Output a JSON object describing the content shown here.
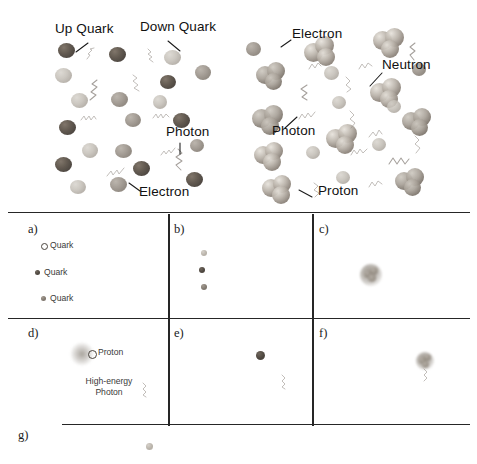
{
  "figure": {
    "background_color": "#ffffff",
    "ink_color": "#1a1a1a",
    "particle_color": "#6d6359",
    "photon_color": "#6f6760"
  },
  "top_panels": [
    {
      "id": "plasma-scene",
      "name": "quark-gluon-plasma-scene",
      "labels": [
        {
          "text": "Up Quark",
          "name": "label-up-quark",
          "x": 55,
          "y": 28
        },
        {
          "text": "Down Quark",
          "name": "label-down-quark",
          "x": 140,
          "y": 26
        },
        {
          "text": "Photon",
          "name": "label-photon",
          "x": 168,
          "y": 131
        },
        {
          "text": "Electron",
          "name": "label-electron",
          "x": 139,
          "y": 191
        }
      ]
    },
    {
      "id": "hadron-scene",
      "name": "hadronized-matter-scene",
      "labels": [
        {
          "text": "Electron",
          "name": "label-electron",
          "x": 292,
          "y": 33
        },
        {
          "text": "Neutron",
          "name": "label-neutron",
          "x": 382,
          "y": 64
        },
        {
          "text": "Photon",
          "name": "label-photon",
          "x": 272,
          "y": 130
        },
        {
          "text": "Proton",
          "name": "label-proton",
          "x": 318,
          "y": 190
        }
      ]
    }
  ],
  "grid_panels": [
    {
      "tag": "a)",
      "name": "panel-a",
      "caption_items": [
        {
          "text": "Quark",
          "marker": "open-circle",
          "x": 44,
          "y": 240
        },
        {
          "text": "Quark",
          "marker": "solid-dark",
          "x": 38,
          "y": 266
        },
        {
          "text": "Quark",
          "marker": "solid-mid",
          "x": 44,
          "y": 292
        }
      ]
    },
    {
      "tag": "b)",
      "name": "panel-b",
      "caption_items": []
    },
    {
      "tag": "c)",
      "name": "panel-c",
      "caption_items": []
    },
    {
      "tag": "d)",
      "name": "panel-d",
      "caption_items": [
        {
          "text": "Proton",
          "marker": "open-circle",
          "x": 98,
          "y": 349
        },
        {
          "text": "High-energy Photon",
          "marker": "none",
          "x": 96,
          "y": 380
        }
      ]
    },
    {
      "tag": "e)",
      "name": "panel-e",
      "caption_items": []
    },
    {
      "tag": "f)",
      "name": "panel-f",
      "caption_items": []
    },
    {
      "tag": "g)",
      "name": "panel-g",
      "caption_items": []
    }
  ],
  "grid_labels": {
    "a": "a)",
    "b": "b)",
    "c": "c)",
    "d": "d)",
    "e": "e)",
    "f": "f)",
    "g": "g)"
  },
  "mini_text": {
    "quark": "Quark",
    "proton": "Proton",
    "high_energy_photon_line1": "High-energy",
    "high_energy_photon_line2": "Photon"
  },
  "callouts": {
    "up_quark": "Up Quark",
    "down_quark": "Down Quark",
    "photon": "Photon",
    "electron": "Electron",
    "neutron": "Neutron",
    "proton": "Proton"
  }
}
